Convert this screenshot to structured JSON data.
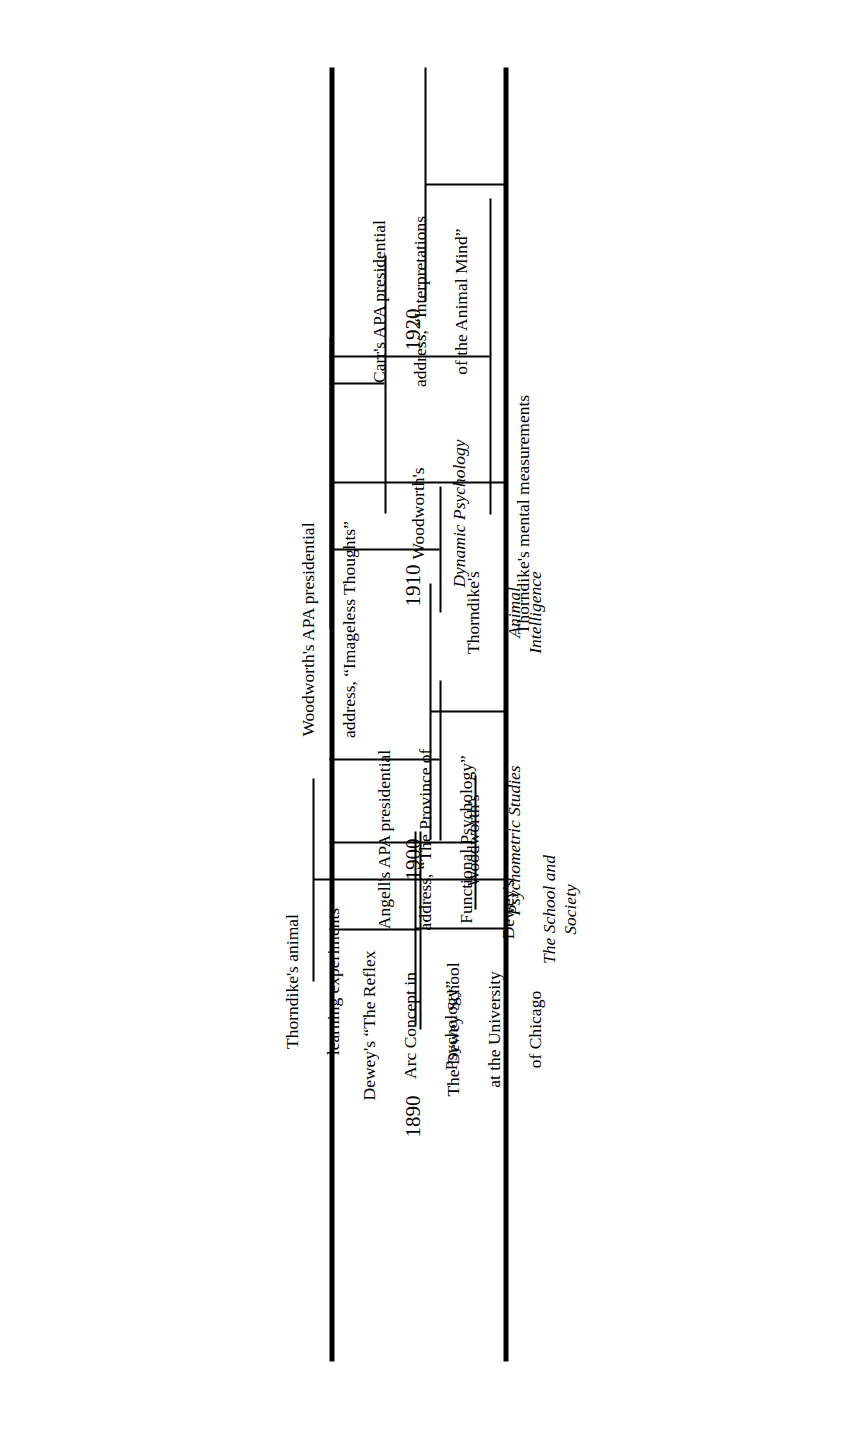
{
  "figure": {
    "orientation": "rotated-90-ccw",
    "axis_color": "#000000",
    "background": "#ffffff",
    "year_axis": {
      "ticks": [
        "1890",
        "1900",
        "1910",
        "1920"
      ],
      "range": [
        1888,
        1924
      ]
    }
  },
  "upper_timeline": {
    "name": "upper-timeline",
    "events": [
      {
        "id": "thorndike-animal-learning",
        "year": 1898,
        "label": "Thorndike's animal\nlearning experiments",
        "italic_part": ""
      },
      {
        "id": "dewey-reflex-arc",
        "year": 1896,
        "label": "Dewey's “The Reflex\nArc Concept in\nPsychology”",
        "italic_part": ""
      },
      {
        "id": "angell-apa-address",
        "year": 1906,
        "label": "Angell's APA presidential\naddress, “The Province of\nFunctional Psychology”",
        "italic_part": ""
      },
      {
        "id": "woodworth-imageless-thoughts",
        "year": 1914,
        "label": "Woodworth's APA presidential\naddress, “Imageless Thoughts”",
        "italic_part": ""
      },
      {
        "id": "carr-animal-mind",
        "year": 1926,
        "label": "Carr's APA presidential\naddress, “Interpretations\nof the Animal Mind”",
        "italic_part": ""
      }
    ]
  },
  "lower_timeline": {
    "name": "lower-timeline",
    "events": [
      {
        "id": "dewey-school-chicago",
        "year": 1896,
        "label_plain": "The Dewey School\nat the University\nof Chicago",
        "label_italic": ""
      },
      {
        "id": "dewey-school-and-society",
        "year": 1899,
        "label_plain": "Dewey's",
        "label_italic": "The School and Society"
      },
      {
        "id": "woodworth-psychometric-studies",
        "year": 1902,
        "label_plain": "Woodworth's",
        "label_italic": "Psychometric Studies"
      },
      {
        "id": "thorndike-animal-intelligence",
        "year": 1911,
        "label_plain": "Thorndike's",
        "label_italic": "Animal Intelligence"
      },
      {
        "id": "woodworth-dynamic-psychology",
        "year": 1918,
        "label_plain": "Woodworth's",
        "label_italic": "Dynamic Psychology"
      },
      {
        "id": "thorndike-mental-measurements",
        "year": 1919,
        "label_plain": "Thorndike's mental measurements",
        "label_italic": ""
      }
    ]
  },
  "years": {
    "y1890": "1890",
    "y1900": "1900",
    "y1910": "1910",
    "y1920": "1920"
  },
  "events_text": {
    "thorndike_animal_learning_l1": "Thorndike's animal",
    "thorndike_animal_learning_l2": "learning experiments",
    "dewey_reflex_l1": "Dewey's “The Reflex",
    "dewey_reflex_l2": "Arc Concept in",
    "dewey_reflex_l3": "Psychology”",
    "angell_l1": "Angell's APA presidential",
    "angell_l2": "address, “The Province of",
    "angell_l3": "Functional Psychology”",
    "woodworth_imageless_l1": "Woodworth's APA presidential",
    "woodworth_imageless_l2": "address, “Imageless Thoughts”",
    "carr_l1": "Carr's APA presidential",
    "carr_l2": "address, “Interpretations",
    "carr_l3": "of the Animal Mind”",
    "dewey_school_l1": "The Dewey School",
    "dewey_school_l2": "at the University",
    "dewey_school_l3": "of Chicago",
    "dewey_society_l1": "Dewey's",
    "dewey_society_l2": "The School and Society",
    "woodworth_psycho_l1": "Woodworth's",
    "woodworth_psycho_l2": "Psychometric Studies",
    "thorndike_animint_l1": "Thorndike's",
    "thorndike_animint_l2": "Animal Intelligence",
    "woodworth_dynamic_l1": "Woodworth's",
    "woodworth_dynamic_l2": "Dynamic Psychology",
    "thorndike_mental_l1": "Thorndike's mental measurements"
  }
}
